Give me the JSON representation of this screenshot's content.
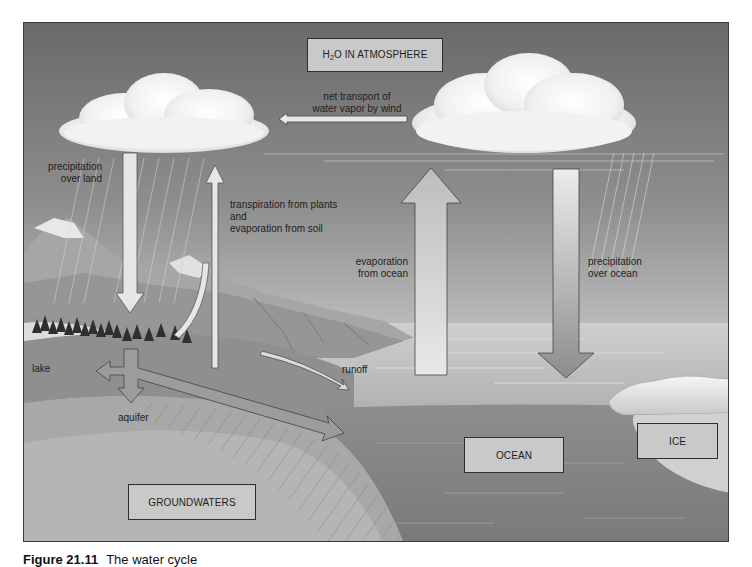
{
  "diagram": {
    "title_box": {
      "prefix": "H",
      "subscript": "2",
      "suffix": "O IN ATMOSPHERE"
    },
    "labels": {
      "net_transport": [
        "net transport of",
        "water vapor by wind"
      ],
      "precip_land": [
        "precipitation",
        "over land"
      ],
      "transpiration": [
        "transpiration from plants",
        "and",
        "evaporation from soil"
      ],
      "evap_ocean": [
        "evaporation",
        "from ocean"
      ],
      "precip_ocean": [
        "precipitation",
        "over ocean"
      ],
      "lake": "lake",
      "runoff": "runoff",
      "aquifer": "aquifer"
    },
    "boxes": {
      "ocean": "OCEAN",
      "ice": "ICE",
      "groundwaters": "GROUNDWATERS"
    },
    "colors": {
      "sky_top": "#6e6e6e",
      "sky_bottom": "#c4c4c4",
      "ocean_surface": "#bdbdbd",
      "ocean_deep": "#8a8a8a",
      "land": "#9a9a9a",
      "mountain": "#a8a8a8",
      "cloud": "#f4f4f4",
      "box_fill": "#c9c9c9"
    }
  },
  "caption": {
    "figure": "Figure 21.11",
    "text": "The water cycle"
  }
}
